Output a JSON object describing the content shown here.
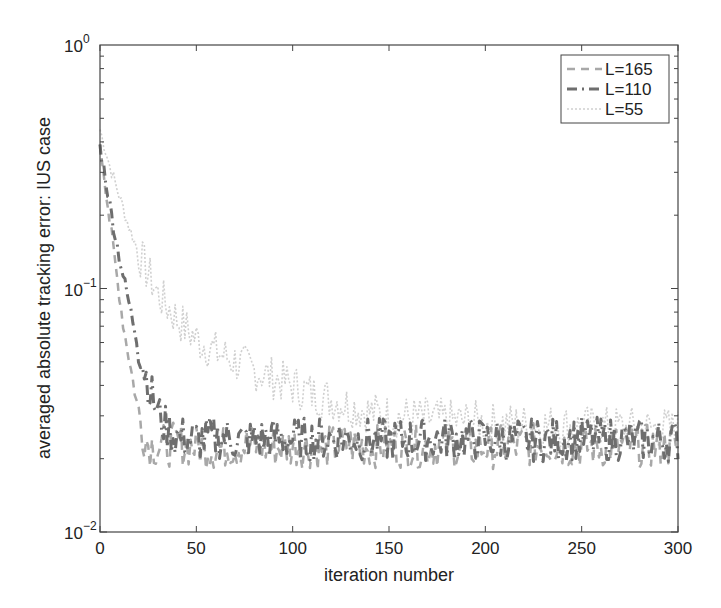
{
  "chart_data": {
    "type": "line",
    "title": "",
    "xlabel": "iteration number",
    "ylabel": "averaged absolute tracking error: IUS case",
    "xlim": [
      0,
      300
    ],
    "ylim": [
      0.01,
      1
    ],
    "yscale": "log",
    "grid": false,
    "legend_position": "upper right",
    "x_ticks": [
      0,
      50,
      100,
      150,
      200,
      250,
      300
    ],
    "x_tick_labels": [
      "0",
      "50",
      "100",
      "150",
      "200",
      "250",
      "300"
    ],
    "y_ticks": [
      1,
      0.1,
      0.01
    ],
    "y_tick_labels": [
      {
        "base": "10",
        "exp": "0"
      },
      {
        "base": "10",
        "exp": "-1"
      },
      {
        "base": "10",
        "exp": "-2"
      }
    ],
    "series": [
      {
        "name": "L=165",
        "label": "L=165",
        "color": "#a8a8a8",
        "dash": "8,6",
        "width": 2.5,
        "x": [
          0,
          2,
          5,
          8,
          10,
          12,
          15,
          18,
          20,
          22,
          25,
          30,
          40,
          50,
          60,
          75,
          90,
          100,
          115,
          125,
          150,
          175,
          200,
          225,
          250,
          275,
          300
        ],
        "y": [
          0.4,
          0.3,
          0.19,
          0.125,
          0.095,
          0.072,
          0.052,
          0.038,
          0.031,
          0.026,
          0.023,
          0.0225,
          0.023,
          0.0225,
          0.022,
          0.0228,
          0.0222,
          0.0226,
          0.022,
          0.0228,
          0.0224,
          0.0226,
          0.0222,
          0.0228,
          0.0224,
          0.0226,
          0.0224
        ]
      },
      {
        "name": "L=110",
        "label": "L=110",
        "color": "#6e6e6e",
        "dash": "10,5,2,5",
        "width": 3,
        "x": [
          0,
          3,
          6,
          10,
          14,
          18,
          22,
          26,
          30,
          34,
          38,
          42,
          50,
          60,
          75,
          90,
          100,
          125,
          150,
          175,
          200,
          225,
          250,
          275,
          300
        ],
        "y": [
          0.38,
          0.28,
          0.2,
          0.135,
          0.095,
          0.068,
          0.05,
          0.038,
          0.031,
          0.027,
          0.025,
          0.0245,
          0.024,
          0.0245,
          0.0238,
          0.0242,
          0.024,
          0.0243,
          0.0238,
          0.0242,
          0.024,
          0.0238,
          0.0242,
          0.024,
          0.0238
        ]
      },
      {
        "name": "L=55",
        "label": "L=55",
        "color": "#d0d0d0",
        "dash": "2,2",
        "width": 1.6,
        "x": [
          0,
          5,
          10,
          15,
          20,
          25,
          30,
          40,
          50,
          60,
          75,
          90,
          100,
          110,
          125,
          140,
          150,
          175,
          200,
          225,
          250,
          275,
          300
        ],
        "y": [
          0.45,
          0.32,
          0.24,
          0.18,
          0.14,
          0.115,
          0.095,
          0.075,
          0.062,
          0.055,
          0.048,
          0.043,
          0.04,
          0.037,
          0.034,
          0.031,
          0.03,
          0.029,
          0.028,
          0.0275,
          0.027,
          0.0268,
          0.0265
        ]
      }
    ]
  },
  "legend": {
    "items": [
      {
        "label": "L=165"
      },
      {
        "label": "L=110"
      },
      {
        "label": "L=55"
      }
    ]
  }
}
